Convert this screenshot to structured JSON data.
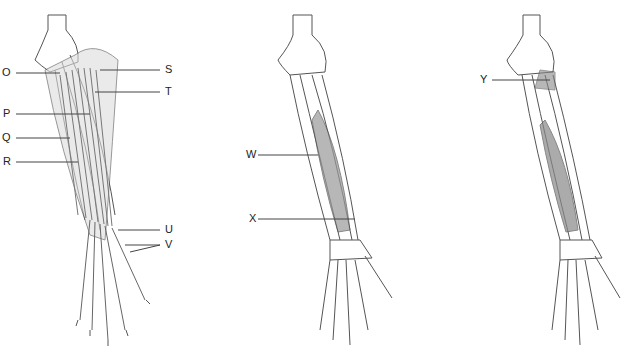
{
  "figure": {
    "panels": [
      {
        "id": "left",
        "description": "Forearm, posterior view with superficial extensor muscles"
      },
      {
        "id": "middle",
        "description": "Forearm, posterior view with deep muscles"
      },
      {
        "id": "right",
        "description": "Forearm, posterior view with deepest muscle"
      }
    ],
    "labels": {
      "O": "O",
      "P": "P",
      "Q": "Q",
      "R": "R",
      "S": "S",
      "T": "T",
      "U": "U",
      "V": "V",
      "W": "W",
      "X": "X",
      "Y": "Y"
    }
  },
  "colors": {
    "line": "#444444",
    "muscle": "#8a8a8a",
    "bone": "#ffffff"
  }
}
